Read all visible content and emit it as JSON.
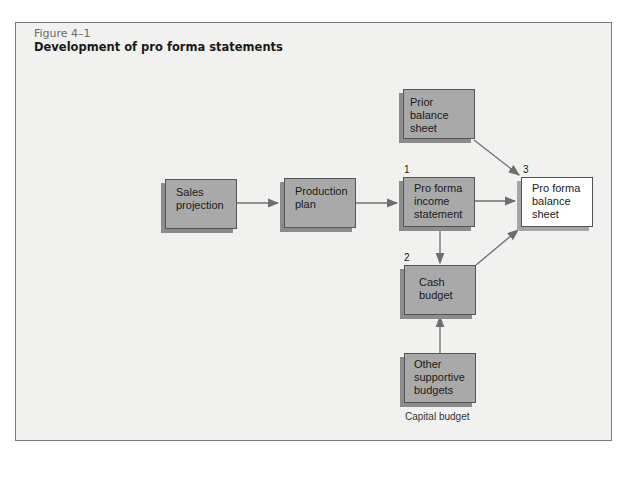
{
  "figure": {
    "number": "Figure 4–1",
    "title": "Development of pro forma statements"
  },
  "nodes": {
    "sales_projection": {
      "label_line1": "Sales",
      "label_line2": "projection"
    },
    "production_plan": {
      "label_line1": "Production",
      "label_line2": "plan"
    },
    "prior_balance_sheet": {
      "label_line1": "Prior balance",
      "label_line2": "sheet"
    },
    "income_statement": {
      "number": "1",
      "label_line1": "Pro forma",
      "label_line2": "income",
      "label_line3": "statement"
    },
    "balance_sheet": {
      "number": "3",
      "label_line1": "Pro forma",
      "label_line2": "balance",
      "label_line3": "sheet"
    },
    "cash_budget": {
      "number": "2",
      "label_line1": "Cash",
      "label_line2": "budget"
    },
    "other_budgets": {
      "label_line1": "Other",
      "label_line2": "supportive",
      "label_line3": "budgets",
      "caption": "Capital budget"
    }
  },
  "edges": [
    {
      "from": "sales_projection",
      "to": "production_plan"
    },
    {
      "from": "production_plan",
      "to": "income_statement"
    },
    {
      "from": "income_statement",
      "to": "balance_sheet"
    },
    {
      "from": "prior_balance_sheet",
      "to": "balance_sheet"
    },
    {
      "from": "income_statement",
      "to": "cash_budget"
    },
    {
      "from": "cash_budget",
      "to": "balance_sheet"
    },
    {
      "from": "other_budgets",
      "to": "cash_budget"
    }
  ],
  "colors": {
    "frame_bg": "#f1f1ef",
    "box_fill": "#a9a9a9",
    "result_box_fill": "#ffffff",
    "arrow": "#6e6e6e"
  }
}
